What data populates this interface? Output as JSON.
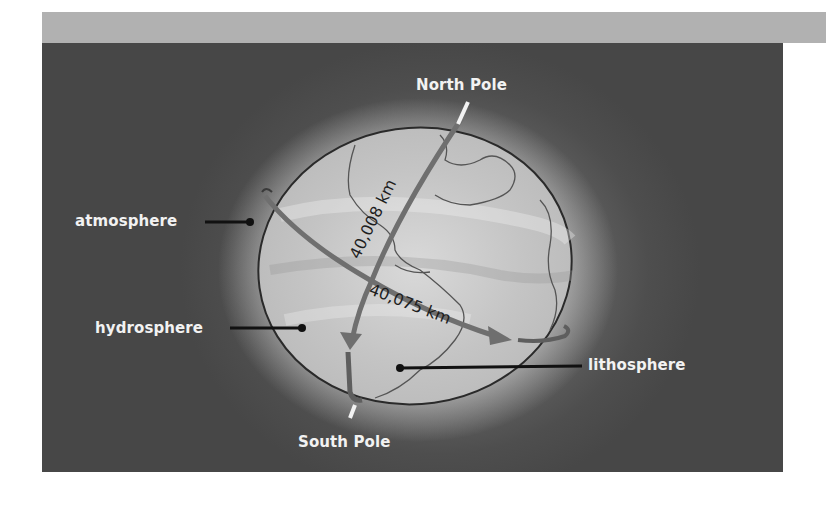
{
  "figure": {
    "colors": {
      "top_band": "#b1b1b1",
      "panel_background": "#4a4a4a",
      "globe_fill": "#c8c8c8",
      "label_text": "#f2f2f2",
      "measurement_text": "#1e1e1e",
      "arrow": "#6f6f6f"
    },
    "labels": {
      "north_pole": "North Pole",
      "south_pole": "South Pole",
      "atmosphere": "atmosphere",
      "hydrosphere": "hydrosphere",
      "lithosphere": "lithosphere"
    },
    "measurements": {
      "meridional_circumference": "40,008 km",
      "equatorial_circumference": "40,075 km"
    }
  }
}
